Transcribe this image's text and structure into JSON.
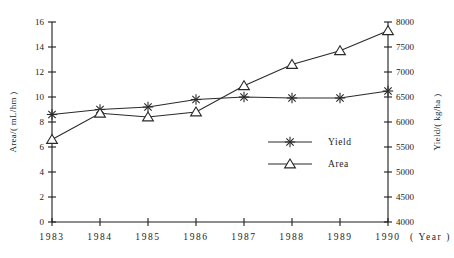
{
  "chart_data": {
    "type": "line",
    "title": "",
    "xlabel": "( Year )",
    "x": [
      "1983",
      "1984",
      "1985",
      "1986",
      "1987",
      "1988",
      "1989",
      "1990"
    ],
    "grid": false,
    "legend_position": "center-right-inside",
    "axes": {
      "left": {
        "label": "Area/( mL/hm )",
        "ticks": [
          "0",
          "2",
          "4",
          "6",
          "8",
          "10",
          "12",
          "14",
          "16"
        ],
        "min": 0,
        "max": 16,
        "step": 2
      },
      "right": {
        "label": "Yield/( kg/ha )",
        "ticks": [
          "4000",
          "4500",
          "5000",
          "5500",
          "6000",
          "6500",
          "7000",
          "7500",
          "8000"
        ],
        "min": 4000,
        "max": 8000,
        "step": 500
      }
    },
    "series": [
      {
        "name": "Yield",
        "marker": "asterisk-star",
        "axis": "right",
        "unit": "kg/ha",
        "values": [
          6150,
          6250,
          6300,
          6450,
          6500,
          6480,
          6480,
          6620
        ]
      },
      {
        "name": "Area",
        "marker": "triangle",
        "axis": "left",
        "unit": "mL/hm",
        "values": [
          6.6,
          8.7,
          8.4,
          8.8,
          10.9,
          12.6,
          13.7,
          15.3
        ]
      }
    ]
  },
  "legend": {
    "items": [
      {
        "label": "Yield",
        "marker": "asterisk-star"
      },
      {
        "label": "Area",
        "marker": "triangle"
      }
    ]
  },
  "colors": {
    "ink": "#1d1d1d",
    "line": "#2a2a2a",
    "background": "#ffffff"
  }
}
